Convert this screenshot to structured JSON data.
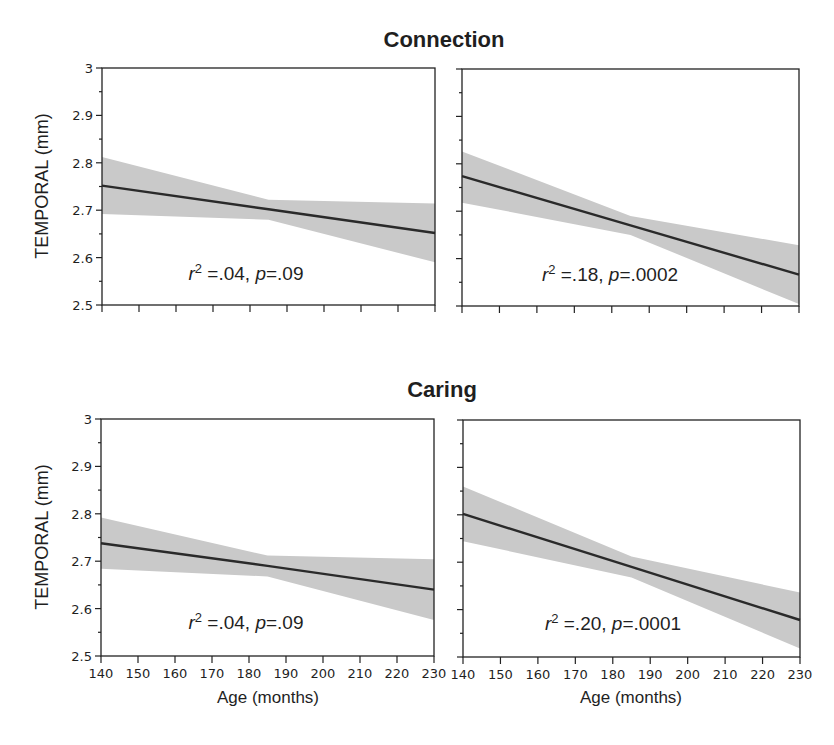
{
  "figure": {
    "rows": [
      {
        "title": "Connection"
      },
      {
        "title": "Caring"
      }
    ],
    "ylabel": "TEMPORAL (mm)",
    "xlabel": "Age (months)"
  },
  "chart_data": [
    {
      "type": "line",
      "group": "Connection",
      "panel": "top-left",
      "title": "Connection",
      "xlabel": "",
      "ylabel": "TEMPORAL (mm)",
      "xlim": [
        140,
        230
      ],
      "ylim": [
        2.5,
        3
      ],
      "x_ticks": [
        140,
        150,
        160,
        170,
        180,
        190,
        200,
        210,
        220,
        230
      ],
      "y_ticks": [
        2.5,
        2.6,
        2.7,
        2.8,
        2.9,
        3
      ],
      "y_tick_labels": [
        "2.5",
        "2.6",
        "2.7",
        "2.8",
        "2.9",
        "3"
      ],
      "x_tick_labels_shown": false,
      "x": [
        140,
        185,
        230
      ],
      "fit": [
        2.752,
        2.702,
        2.652
      ],
      "ci_upper": [
        2.812,
        2.722,
        2.714
      ],
      "ci_lower": [
        2.692,
        2.68,
        2.59
      ],
      "annotation": {
        "r2": ".04",
        "p": ".09",
        "text": "r² =.04, p=.09"
      },
      "grid": false
    },
    {
      "type": "line",
      "group": "Connection",
      "panel": "top-right",
      "title": "Connection",
      "xlabel": "",
      "ylabel": "",
      "xlim": [
        140,
        230
      ],
      "ylim": [
        2.5,
        3
      ],
      "x_ticks": [
        140,
        150,
        160,
        170,
        180,
        190,
        200,
        210,
        220,
        230
      ],
      "y_ticks": [
        2.5,
        2.6,
        2.7,
        2.8,
        2.9,
        3
      ],
      "y_tick_labels_shown": false,
      "x_tick_labels_shown": false,
      "x": [
        140,
        185,
        230
      ],
      "fit": [
        2.774,
        2.67,
        2.566
      ],
      "ci_upper": [
        2.826,
        2.69,
        2.628
      ],
      "ci_lower": [
        2.718,
        2.65,
        2.504
      ],
      "annotation": {
        "r2": ".18",
        "p": ".0002",
        "text": "r² =.18, p=.0002"
      },
      "grid": false
    },
    {
      "type": "line",
      "group": "Caring",
      "panel": "bottom-left",
      "title": "Caring",
      "xlabel": "Age (months)",
      "ylabel": "TEMPORAL (mm)",
      "xlim": [
        140,
        230
      ],
      "ylim": [
        2.5,
        3
      ],
      "x_ticks": [
        140,
        150,
        160,
        170,
        180,
        190,
        200,
        210,
        220,
        230
      ],
      "x_tick_labels": [
        "140",
        "150",
        "160",
        "170",
        "180",
        "190",
        "200",
        "210",
        "220",
        "230"
      ],
      "y_ticks": [
        2.5,
        2.6,
        2.7,
        2.8,
        2.9,
        3
      ],
      "y_tick_labels": [
        "2.5",
        "2.6",
        "2.7",
        "2.8",
        "2.9",
        "3"
      ],
      "x": [
        140,
        185,
        230
      ],
      "fit": [
        2.738,
        2.69,
        2.64
      ],
      "ci_upper": [
        2.792,
        2.712,
        2.704
      ],
      "ci_lower": [
        2.684,
        2.668,
        2.576
      ],
      "annotation": {
        "r2": ".04",
        "p": ".09",
        "text": "r² =.04, p=.09"
      },
      "grid": false
    },
    {
      "type": "line",
      "group": "Caring",
      "panel": "bottom-right",
      "title": "Caring",
      "xlabel": "Age (months)",
      "ylabel": "",
      "xlim": [
        140,
        230
      ],
      "ylim": [
        2.5,
        3
      ],
      "x_ticks": [
        140,
        150,
        160,
        170,
        180,
        190,
        200,
        210,
        220,
        230
      ],
      "x_tick_labels": [
        "140",
        "150",
        "160",
        "170",
        "180",
        "190",
        "200",
        "210",
        "220",
        "230"
      ],
      "y_ticks": [
        2.5,
        2.6,
        2.7,
        2.8,
        2.9,
        3
      ],
      "y_tick_labels_shown": false,
      "x": [
        140,
        185,
        230
      ],
      "fit": [
        2.802,
        2.69,
        2.578
      ],
      "ci_upper": [
        2.86,
        2.712,
        2.636
      ],
      "ci_lower": [
        2.744,
        2.668,
        2.518
      ],
      "annotation": {
        "r2": ".20",
        "p": ".0001",
        "text": "r² =.20, p=.0001"
      },
      "grid": false
    }
  ],
  "colors": {
    "band": "#c9c9c9",
    "fit_line": "#2a2a2a",
    "axes": "#222222",
    "text": "#1f1f1f"
  }
}
